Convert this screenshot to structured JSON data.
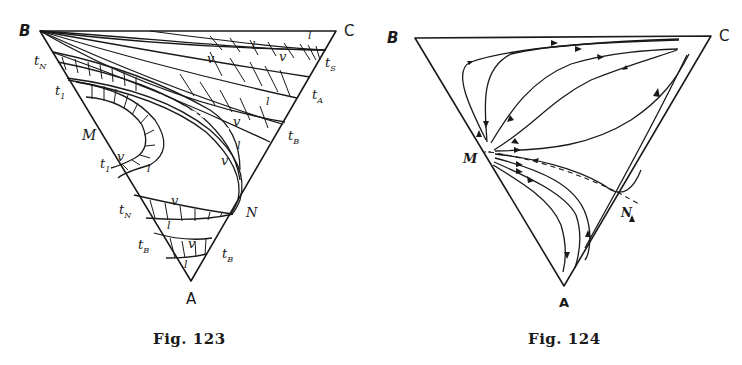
{
  "figures": [
    {
      "id": "fig-123",
      "caption": "Fig. 123",
      "vertices": {
        "B": "B",
        "C": "C",
        "A": "A",
        "M": "M",
        "N": "N"
      },
      "edge_labels_left": [
        "t_N",
        "t_1",
        "M",
        "t_1",
        "t_N",
        "t_B"
      ],
      "edge_labels_right": [
        "t_S",
        "t_A",
        "t_B",
        "N",
        "t_B"
      ],
      "phase_labels": {
        "vapor": "v",
        "liquid": "l"
      },
      "labels": {
        "tN_top": "t",
        "tN_top_sub": "N",
        "t1_top": "t",
        "t1_top_sub": "1",
        "t1_bot": "t",
        "t1_bot_sub": "1",
        "tN_bot": "t",
        "tN_bot_sub": "N",
        "tB_left": "t",
        "tB_left_sub": "B",
        "tS": "t",
        "tS_sub": "S",
        "tA": "t",
        "tA_sub": "A",
        "tB_right_top": "t",
        "tB_right_top_sub": "B",
        "tB_right_bot": "t",
        "tB_right_bot_sub": "B"
      }
    },
    {
      "id": "fig-124",
      "caption": "Fig. 124",
      "vertices": {
        "B": "B",
        "C": "C",
        "A": "A",
        "M": "M",
        "N": "N"
      },
      "description": "Distillation residue curves: trajectories diverging from M toward C and toward A, separated by a dashed line M–N"
    }
  ],
  "colors": {
    "ink": "#1a1a1a",
    "paper": "#ffffff"
  }
}
